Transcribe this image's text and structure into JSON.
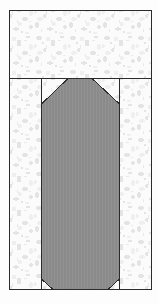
{
  "figure": {
    "canvas": {
      "width": 159,
      "height": 304,
      "background": "#fdfdfd"
    },
    "frame": {
      "name": "outer-frame",
      "x": 9,
      "y": 10,
      "width": 143,
      "height": 280,
      "stroke": "#2b2b2b",
      "stroke_width": 1,
      "fill": "#fafafa"
    },
    "line_color": "#2b2b2b",
    "hatch_texture": {
      "name": "speckle-hatch",
      "base_color": "#fbfbfb",
      "fleck_color": "#e2e2e2",
      "fleck_color_light": "#eeeeee",
      "description": "mottled light-gray speckled masonry hatch"
    },
    "regions": [
      {
        "name": "top-band",
        "label": "upper masonry course",
        "x": 9,
        "y": 10,
        "width": 143,
        "height": 68,
        "fill": "hatch"
      },
      {
        "name": "left-jamb",
        "label": "left masonry jamb",
        "x": 9,
        "y": 78,
        "width": 32,
        "height": 212,
        "fill": "hatch"
      },
      {
        "name": "right-jamb",
        "label": "right masonry jamb",
        "x": 120,
        "y": 78,
        "width": 32,
        "height": 212,
        "fill": "hatch"
      },
      {
        "name": "center-channel",
        "label": "central recess behind pier",
        "x": 41,
        "y": 78,
        "width": 79,
        "height": 212,
        "fill": "hatch"
      }
    ],
    "divider_lines": [
      {
        "name": "horizontal-course-line",
        "x1": 9,
        "y1": 78,
        "x2": 152,
        "y2": 78
      },
      {
        "name": "left-jamb-line",
        "x1": 41,
        "y1": 78,
        "x2": 41,
        "y2": 290
      },
      {
        "name": "right-jamb-line",
        "x1": 120,
        "y1": 78,
        "x2": 120,
        "y2": 290
      }
    ],
    "pier": {
      "name": "pier-polygon",
      "label": "gray chamfered pier",
      "fill": "#8a8a8a",
      "stroke": "#2b2b2b",
      "stroke_width": 1,
      "stripe_color": "#939393",
      "points": "68,78 92,78 119,104 119,279 108,290 53,290 42,279 42,104",
      "top_chamfer_span_px": 26,
      "bottom_chamfer_span_px": 11,
      "flat_top_width_px": 24
    }
  }
}
